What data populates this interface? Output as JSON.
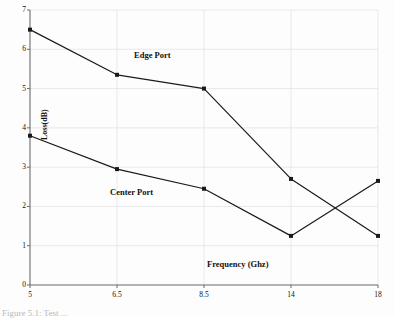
{
  "chart_data": {
    "type": "line",
    "title": "",
    "xlabel": "Frequency (Ghz)",
    "ylabel": "Loss(dB)",
    "categories": [
      "5",
      "6.5",
      "8.5",
      "14",
      "18"
    ],
    "x_tick_labels": [
      "5",
      "6.5",
      "8.5",
      "14",
      "18"
    ],
    "y_tick_labels": [
      "0",
      "1",
      "2",
      "3",
      "4",
      "5",
      "6",
      "7"
    ],
    "ylim": [
      0,
      7
    ],
    "y_ticks": [
      0,
      1,
      2,
      3,
      4,
      5,
      6,
      7
    ],
    "grid": true,
    "legend_position": "inline-annotation",
    "series": [
      {
        "name": "Edge Port",
        "values": [
          6.5,
          5.35,
          5.0,
          2.7,
          1.25
        ],
        "marker": "square",
        "color": "#1a1a1a"
      },
      {
        "name": "Center Port",
        "values": [
          3.8,
          2.95,
          2.45,
          1.25,
          2.65
        ],
        "marker": "square",
        "color": "#1a1a1a"
      }
    ],
    "annotations": [
      {
        "text": "Edge Port",
        "x_px": 134,
        "y_px": 56
      },
      {
        "text": "Center Port",
        "x_px": 110,
        "y_px": 192
      }
    ]
  },
  "caption": {
    "text": "Figure 5.1: Test ..."
  },
  "colors": {
    "line": "#1a1a1a",
    "grid": "#e3e3e3",
    "axis": "#6b6b6b",
    "text": "#111111",
    "background": "#fdfdfd"
  }
}
